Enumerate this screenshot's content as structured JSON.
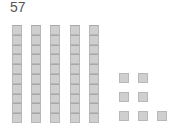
{
  "number": "57",
  "tens": 5,
  "ones": 7,
  "colors": {
    "block_fill": "#cfcfcf",
    "block_border": "#b8b8b8",
    "text": "#555555"
  }
}
